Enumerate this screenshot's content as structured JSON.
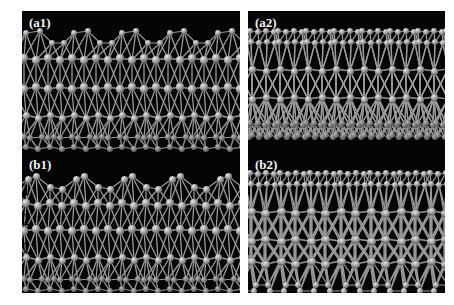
{
  "figure": {
    "background_color": "#ffffff",
    "panel_background_color": "#050505",
    "atom_color": "#8e8e8e",
    "bond_color": "#9a9a9a",
    "label_color": "#ffffff",
    "width": 454,
    "height": 305
  },
  "panels": [
    {
      "id": "a1",
      "label": "(a1)",
      "x": 22,
      "y": 11,
      "width": 218,
      "height": 142,
      "description": "Side view atomic structure, black background, gray spheres with bonds"
    },
    {
      "id": "a2",
      "label": "(a2)",
      "x": 248,
      "y": 11,
      "width": 197,
      "height": 142,
      "description": "Side view atomic structure, black background, gray spheres with bonds"
    },
    {
      "id": "b1",
      "label": "(b1)",
      "x": 22,
      "y": 153,
      "width": 218,
      "height": 140,
      "description": "Side view atomic structure with labelled surface atoms"
    },
    {
      "id": "b2",
      "label": "(b2)",
      "x": 248,
      "y": 153,
      "width": 197,
      "height": 140,
      "description": "Side view atomic structure, black background, gray spheres with bonds"
    }
  ],
  "annotations": [
    {
      "panel": "b1",
      "text": "2",
      "num_x": 104,
      "num_y": 1,
      "arrow_x": 108,
      "arrow_y": 13,
      "arrow_len": 10,
      "thick": false
    },
    {
      "panel": "b1",
      "text": "1",
      "num_x": 120,
      "num_y": 3,
      "arrow_x": 124,
      "arrow_y": 15,
      "arrow_len": 12,
      "thick": true
    },
    {
      "panel": "b1",
      "text": "2",
      "num_x": 164,
      "num_y": 1,
      "arrow_x": 168,
      "arrow_y": 13,
      "arrow_len": 10,
      "thick": false
    },
    {
      "panel": "b1",
      "text": "1",
      "num_x": 180,
      "num_y": 1,
      "arrow_x": 184,
      "arrow_y": 13,
      "arrow_len": 12,
      "thick": true
    }
  ]
}
